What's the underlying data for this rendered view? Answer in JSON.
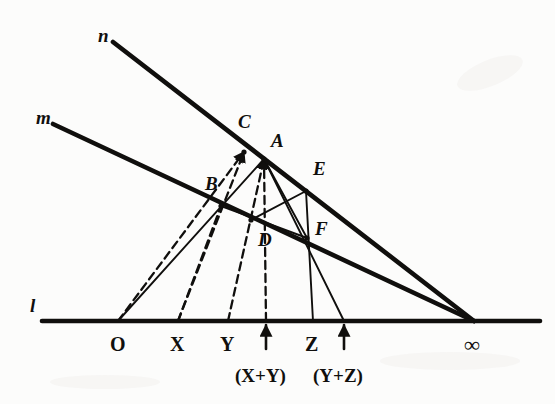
{
  "figure": {
    "background_color": "#fcfcfb",
    "ink_color": "#100f0d",
    "width": 555,
    "height": 404
  },
  "lines": [
    {
      "id": "n",
      "label": "n",
      "label_x": 98,
      "label_y": 26,
      "style": "solid-heavy",
      "from": [
        113,
        42
      ],
      "to": [
        474,
        321
      ]
    },
    {
      "id": "m",
      "label": "m",
      "label_x": 36,
      "label_y": 108,
      "style": "solid-heavy",
      "from": [
        53,
        124
      ],
      "to": [
        474,
        321
      ]
    },
    {
      "id": "l",
      "label": "l",
      "label_x": 30,
      "label_y": 296,
      "style": "solid-heavy",
      "from": [
        42,
        321
      ],
      "to": [
        540,
        321
      ]
    }
  ],
  "points": [
    {
      "name": "A",
      "label": "A",
      "x": 264,
      "y": 159,
      "label_x": 271,
      "label_y": 131
    },
    {
      "name": "B",
      "label": "B",
      "x": 221,
      "y": 206,
      "label_x": 205,
      "label_y": 174
    },
    {
      "name": "C",
      "label": "C",
      "x": 244,
      "y": 152,
      "label_x": 238,
      "label_y": 112
    },
    {
      "name": "D",
      "label": "D",
      "x": 251,
      "y": 220,
      "label_x": 258,
      "label_y": 230
    },
    {
      "name": "E",
      "label": "E",
      "x": 306,
      "y": 191,
      "label_x": 313,
      "label_y": 159
    },
    {
      "name": "F",
      "label": "F",
      "x": 307,
      "y": 238,
      "label_x": 315,
      "label_y": 219
    }
  ],
  "axis_marks": [
    {
      "name": "O",
      "label": "O",
      "x": 118,
      "x_label": 110,
      "y_label": 334,
      "tick": false,
      "arrow": false
    },
    {
      "name": "X",
      "label": "X",
      "x": 178,
      "x_label": 170,
      "y_label": 334,
      "tick": false,
      "arrow": false
    },
    {
      "name": "Y",
      "label": "Y",
      "x": 228,
      "x_label": 220,
      "y_label": 334,
      "tick": false,
      "arrow": false
    },
    {
      "name": "X+Y",
      "label": "(X+Y)",
      "x": 266,
      "x_label": 235,
      "y_label": 366,
      "tick": false,
      "arrow": true
    },
    {
      "name": "Z",
      "label": "Z",
      "x": 313,
      "x_label": 305,
      "y_label": 334,
      "tick": false,
      "arrow": false
    },
    {
      "name": "Y+Z",
      "label": "(Y+Z)",
      "x": 344,
      "x_label": 313,
      "y_label": 366,
      "tick": false,
      "arrow": true
    },
    {
      "name": "infinity",
      "label": "∞",
      "x": 474,
      "x_label": 464,
      "y_label": 334,
      "tick": false,
      "arrow": false
    }
  ],
  "construction_segments": [
    {
      "name": "O-to-C",
      "style": "dashed",
      "from": [
        118,
        321
      ],
      "to": [
        244,
        152
      ],
      "arrowhead": true
    },
    {
      "name": "X-to-C",
      "style": "dashed",
      "from": [
        178,
        321
      ],
      "to": [
        244,
        152
      ],
      "arrowhead": true
    },
    {
      "name": "X-to-B",
      "style": "dashed",
      "from": [
        178,
        321
      ],
      "to": [
        221,
        206
      ],
      "arrowhead": false
    },
    {
      "name": "Y-to-A",
      "style": "dashed",
      "from": [
        228,
        321
      ],
      "to": [
        264,
        159
      ],
      "arrowhead": true
    },
    {
      "name": "XplusY-to-A",
      "style": "dashed",
      "from": [
        266,
        321
      ],
      "to": [
        264,
        159
      ],
      "arrowhead": true
    },
    {
      "name": "O-to-D-to-A",
      "style": "solid",
      "from": [
        118,
        321
      ],
      "to": [
        264,
        159
      ],
      "arrowhead": false
    },
    {
      "name": "Z-to-E",
      "style": "solid",
      "from": [
        313,
        321
      ],
      "to": [
        306,
        191
      ],
      "arrowhead": false
    },
    {
      "name": "YplusZ-to-A",
      "style": "solid",
      "from": [
        344,
        321
      ],
      "to": [
        264,
        159
      ],
      "arrowhead": false
    },
    {
      "name": "D-to-E",
      "style": "solid",
      "from": [
        251,
        220
      ],
      "to": [
        306,
        191
      ],
      "arrowhead": false
    },
    {
      "name": "A-to-F",
      "style": "solid",
      "from": [
        264,
        159
      ],
      "to": [
        307,
        238
      ],
      "arrowhead": false
    },
    {
      "name": "B-to-F",
      "style": "solid",
      "from": [
        221,
        206
      ],
      "to": [
        307,
        238
      ],
      "arrowhead": false
    }
  ]
}
